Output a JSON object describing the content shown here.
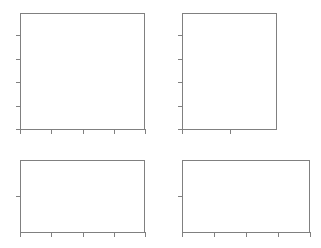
{
  "figure": {
    "title": "",
    "width": 321,
    "height": 248,
    "background_color": "#ffffff",
    "axis_color": "#808080"
  },
  "chart_data": {
    "type": "line",
    "title": "",
    "subtitle": "",
    "xlabel": "",
    "ylabel": "",
    "grid": false,
    "legend": null,
    "series": [],
    "annotations": [],
    "layout": {
      "rows": 2,
      "cols": 2,
      "shared_axes": false
    },
    "panels": [
      {
        "id": "panel-top-left",
        "row": 0,
        "col": 0,
        "title": "",
        "xlabel": "",
        "ylabel": "",
        "x": 20,
        "y": 13,
        "width": 125,
        "height": 117,
        "grid": false,
        "series": [],
        "x_tick_labels": [],
        "y_tick_labels": [],
        "x_tick_positions": [
          0,
          0.25,
          0.5,
          0.75,
          1.0
        ],
        "y_tick_positions": [
          0.0,
          0.2,
          0.4,
          0.6,
          0.8
        ],
        "values": []
      },
      {
        "id": "panel-top-right",
        "row": 0,
        "col": 1,
        "title": "",
        "xlabel": "",
        "ylabel": "",
        "x": 182,
        "y": 13,
        "width": 95,
        "height": 117,
        "grid": false,
        "series": [],
        "x_tick_labels": [],
        "y_tick_labels": [],
        "x_tick_positions": [
          0.0,
          0.5
        ],
        "y_tick_positions": [
          0.0,
          0.2,
          0.4,
          0.6,
          0.8
        ],
        "values": []
      },
      {
        "id": "panel-bottom-left",
        "row": 1,
        "col": 0,
        "title": "",
        "xlabel": "",
        "ylabel": "",
        "x": 20,
        "y": 160,
        "width": 125,
        "height": 73,
        "grid": false,
        "series": [],
        "x_tick_labels": [],
        "y_tick_labels": [],
        "x_tick_positions": [
          0,
          0.25,
          0.5,
          0.75,
          1.0
        ],
        "y_tick_positions": [
          0.5
        ],
        "values": []
      },
      {
        "id": "panel-bottom-right",
        "row": 1,
        "col": 1,
        "title": "",
        "xlabel": "",
        "ylabel": "",
        "x": 182,
        "y": 160,
        "width": 128,
        "height": 73,
        "grid": false,
        "series": [],
        "x_tick_labels": [],
        "y_tick_labels": [],
        "x_tick_positions": [
          0,
          0.25,
          0.5,
          0.75,
          1.0
        ],
        "y_tick_positions": [
          0.5
        ],
        "values": []
      }
    ]
  }
}
